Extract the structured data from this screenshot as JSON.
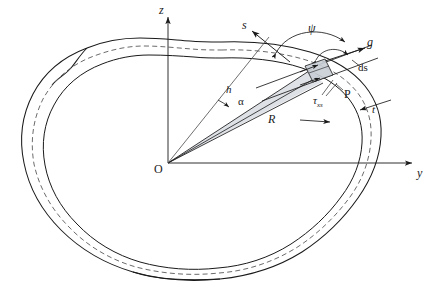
{
  "figure": {
    "background_color": "#ffffff",
    "line_color": "#1a1a1a",
    "shade_color": "#d8dce2",
    "axes": {
      "origin_label": "O",
      "vertical_axis_label": "z",
      "horizontal_axis_label": "y"
    },
    "labels": {
      "tangent_direction": "s",
      "shear_flow_direction": "g",
      "arc_element": "ds",
      "angle_psi": "ψ",
      "angle_alpha": "α",
      "moment_arm": "h",
      "radius": "R",
      "point": "P",
      "wall_thickness": "t",
      "shear_stress": "τ",
      "shear_stress_subscript": "xs"
    }
  }
}
